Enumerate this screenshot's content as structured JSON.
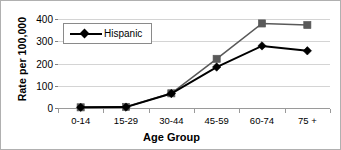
{
  "chart_data": {
    "type": "line",
    "title": "",
    "xlabel": "Age Group",
    "ylabel": "Rate per 100,000",
    "categories": [
      "0-14",
      "15-29",
      "30-44",
      "45-59",
      "60-74",
      "75 +"
    ],
    "ylim": [
      0,
      400
    ],
    "yticks": [
      0,
      100,
      200,
      300,
      400
    ],
    "ytick_labels": [
      "0",
      "100",
      "200",
      "300",
      "400"
    ],
    "grid": true,
    "legend_position": "upper-left-inside",
    "series": [
      {
        "name": "Hispanic",
        "marker": "diamond",
        "color": "#000000",
        "values": [
          3,
          4,
          65,
          184,
          279,
          257
        ]
      },
      {
        "name": "",
        "marker": "square",
        "color": "#595959",
        "values": [
          3,
          5,
          66,
          221,
          380,
          373
        ]
      }
    ]
  },
  "legend": {
    "entries": [
      {
        "label": "Hispanic",
        "marker": "diamond-marker",
        "color": "#000000"
      }
    ]
  },
  "axes": {
    "y_title": "Rate per 100,000",
    "x_title": "Age Group"
  },
  "colors": {
    "series_primary": "#000000",
    "series_secondary": "#595959",
    "gridline": "#d4d4d4",
    "axis": "#9a9a9a",
    "frame": "#b0b0b0"
  }
}
